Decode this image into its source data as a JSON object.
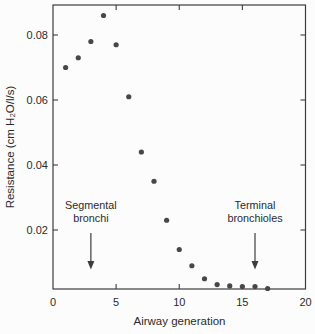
{
  "colors": {
    "frame": "#3d3d3d",
    "text": "#2b2b2b",
    "marker": "#474747",
    "background": "#fcfcfc"
  },
  "chart_data": {
    "type": "scatter",
    "title": "",
    "xlabel": "Airway generation",
    "ylabel": "Resistance (cm H₂O/l/s)",
    "xlim": [
      0,
      20
    ],
    "ylim": [
      0,
      0.089
    ],
    "xticks": [
      0,
      5,
      10,
      15,
      20
    ],
    "xtick_labels": [
      "0",
      "5",
      "10",
      "15",
      "20"
    ],
    "yticks": [
      0.02,
      0.04,
      0.06,
      0.08
    ],
    "ytick_labels": [
      "0.02",
      "0.04",
      "0.06",
      "0.08"
    ],
    "grid": false,
    "tick_style": "inward, mirrored on top and right frame edges",
    "series": [
      {
        "name": "airway-resistance",
        "marker": "circle",
        "color": "#474747",
        "x": [
          1,
          2,
          3,
          4,
          5,
          6,
          7,
          8,
          9,
          10,
          11,
          12,
          13,
          14,
          15,
          16,
          17
        ],
        "y": [
          0.07,
          0.073,
          0.078,
          0.086,
          0.077,
          0.061,
          0.044,
          0.035,
          0.023,
          0.014,
          0.009,
          0.005,
          0.0032,
          0.0028,
          0.0026,
          0.0026,
          0.002
        ]
      }
    ],
    "annotations": [
      {
        "lines": [
          "Segmental",
          "bronchi"
        ],
        "arrow_x": 3,
        "arrow_direction": "down"
      },
      {
        "lines": [
          "Terminal",
          "bronchioles"
        ],
        "arrow_x": 16,
        "arrow_direction": "down"
      }
    ]
  }
}
